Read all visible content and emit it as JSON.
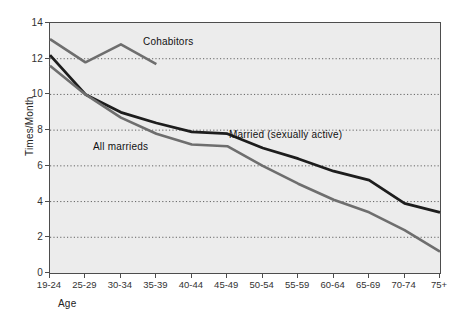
{
  "chart_data": {
    "type": "line",
    "title": "",
    "xlabel": "Age",
    "ylabel": "Times/Month",
    "categories": [
      "19-24",
      "25-29",
      "30-34",
      "35-39",
      "40-44",
      "45-49",
      "50-54",
      "55-59",
      "60-64",
      "65-69",
      "70-74",
      "75+"
    ],
    "xlim": [
      0,
      11
    ],
    "ylim": [
      0,
      14
    ],
    "yticks": [
      0,
      2,
      4,
      6,
      8,
      10,
      12,
      14
    ],
    "grid": "horizontal dotted gridlines at 2,4,6,8,10,12",
    "legend_position": "inline annotations on plot",
    "plot_background": "#ececec",
    "series": [
      {
        "name": "Cohabitors",
        "color": "#6e6e6e",
        "linewidth": 2.6,
        "label_x": "30-34",
        "values": [
          13.1,
          11.8,
          12.8,
          11.7,
          null,
          null,
          null,
          null,
          null,
          null,
          null,
          null
        ]
      },
      {
        "name": "Married (sexually active)",
        "color": "#1d1d1d",
        "linewidth": 2.8,
        "label_x": "50-54",
        "values": [
          12.2,
          10.0,
          9.0,
          8.4,
          7.9,
          7.8,
          7.0,
          6.4,
          5.7,
          5.2,
          3.9,
          3.4
        ]
      },
      {
        "name": "All marrieds",
        "color": "#6e6e6e",
        "linewidth": 2.6,
        "label_x": "40-44",
        "values": [
          11.6,
          10.0,
          8.7,
          7.8,
          7.2,
          7.1,
          6.0,
          5.0,
          4.1,
          3.4,
          2.4,
          1.2
        ]
      }
    ],
    "annotations": [
      {
        "text": "Cohabitors",
        "near_series": "Cohabitors"
      },
      {
        "text": "Married (sexually active)",
        "near_series": "Married (sexually active)"
      },
      {
        "text": "All marrieds",
        "near_series": "All marrieds"
      }
    ]
  },
  "axis": {
    "ylabel": "Times/Month",
    "xlabel": "Age"
  }
}
